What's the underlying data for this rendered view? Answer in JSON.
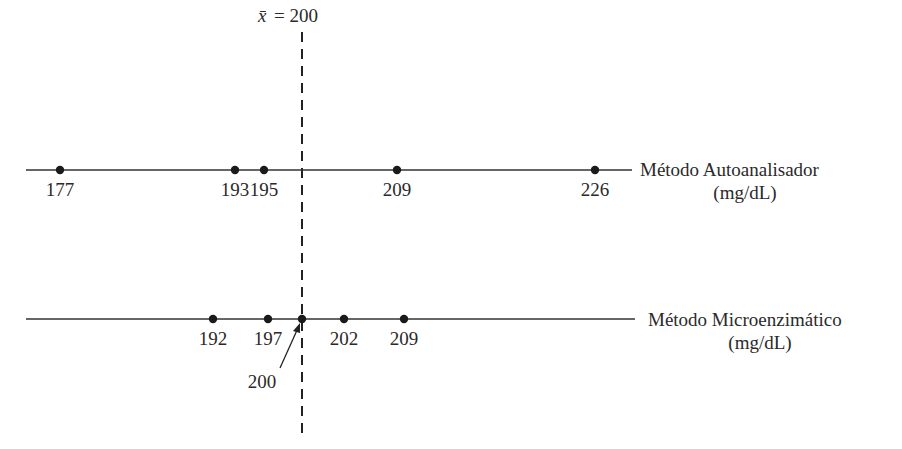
{
  "mean_label": {
    "symbol": "x̄",
    "text": "= 200",
    "value": 200
  },
  "rows": [
    {
      "name": "Método Autoanalisador",
      "unit": "(mg/dL)",
      "points": [
        {
          "value": 177,
          "label": "177",
          "x": 60
        },
        {
          "value": 193,
          "label": "193",
          "x": 235
        },
        {
          "value": 195,
          "label": "195",
          "x": 264
        },
        {
          "value": 209,
          "label": "209",
          "x": 397
        },
        {
          "value": 226,
          "label": "226",
          "x": 595
        }
      ]
    },
    {
      "name": "Método Microenzimático",
      "unit": "(mg/dL)",
      "points": [
        {
          "value": 192,
          "label": "192",
          "x": 213
        },
        {
          "value": 197,
          "label": "197",
          "x": 268
        },
        {
          "value": 200,
          "label": "200",
          "x": 302
        },
        {
          "value": 202,
          "label": "202",
          "x": 344
        },
        {
          "value": 209,
          "label": "209",
          "x": 404
        }
      ]
    }
  ],
  "chart_data": {
    "type": "scatter",
    "title": "",
    "reference_line": {
      "label": "x̄ = 200",
      "value": 200
    },
    "series": [
      {
        "name": "Método Autoanalisador (mg/dL)",
        "values": [
          177,
          193,
          195,
          209,
          226
        ]
      },
      {
        "name": "Método Microenzimático (mg/dL)",
        "values": [
          192,
          197,
          200,
          202,
          209
        ]
      }
    ]
  }
}
